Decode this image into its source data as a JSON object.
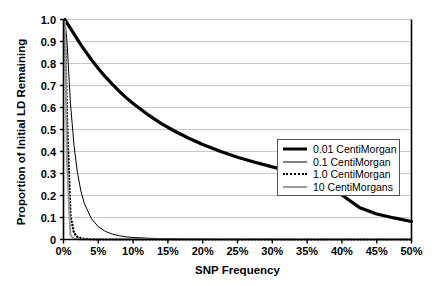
{
  "chart_data": {
    "type": "line",
    "title": "",
    "xlabel": "SNP Frequency",
    "ylabel": "Proportion of Initial LD Remaining",
    "xlim": [
      0,
      50
    ],
    "ylim": [
      0,
      1.0
    ],
    "grid": true,
    "legend_position": "center-right",
    "xticks": [
      "0%",
      "5%",
      "10%",
      "15%",
      "20%",
      "25%",
      "30%",
      "35%",
      "40%",
      "45%",
      "50%"
    ],
    "xtick_values": [
      0,
      5,
      10,
      15,
      20,
      25,
      30,
      35,
      40,
      45,
      50
    ],
    "yticks": [
      "0",
      "0.1",
      "0.2",
      "0.3",
      "0.4",
      "0.5",
      "0.6",
      "0.7",
      "0.8",
      "0.9",
      "1.0"
    ],
    "ytick_values": [
      0,
      0.1,
      0.2,
      0.3,
      0.4,
      0.5,
      0.6,
      0.7,
      0.8,
      0.9,
      1.0
    ],
    "x": [
      0.2,
      0.5,
      1,
      1.5,
      2,
      2.5,
      3,
      4,
      5,
      6,
      7,
      8,
      9,
      10,
      12,
      14,
      16,
      18,
      20,
      22.5,
      25,
      27.5,
      30,
      32.5,
      35,
      37.5,
      40,
      42.5,
      45,
      47.5,
      50
    ],
    "series": [
      {
        "name": "0.01 CentiMorgan",
        "color": "#000000",
        "width": 3.2,
        "style": "solid",
        "values": [
          1.0,
          0.985,
          0.96,
          0.935,
          0.91,
          0.885,
          0.862,
          0.818,
          0.777,
          0.74,
          0.706,
          0.674,
          0.645,
          0.618,
          0.57,
          0.528,
          0.492,
          0.46,
          0.432,
          0.401,
          0.374,
          0.351,
          0.33,
          0.311,
          0.294,
          0.278,
          0.202,
          0.146,
          0.116,
          0.098,
          0.082
        ]
      },
      {
        "name": "0.1 CentiMorgan",
        "color": "#000000",
        "width": 1.0,
        "style": "solid",
        "values": [
          1.0,
          0.9,
          0.62,
          0.43,
          0.305,
          0.22,
          0.163,
          0.095,
          0.058,
          0.037,
          0.025,
          0.017,
          0.012,
          0.009,
          0.006,
          0.004,
          0.003,
          0.002,
          0.002,
          0.001,
          0.001,
          0.001,
          0.001,
          0.0,
          0.0,
          0.0,
          0.0,
          0.0,
          0.0,
          0.0,
          0.0
        ]
      },
      {
        "name": "1.0 CentiMorgan",
        "color": "#000000",
        "width": 2.5,
        "style": "dotted",
        "values": [
          0.98,
          0.55,
          0.11,
          0.03,
          0.012,
          0.006,
          0.003,
          0.001,
          0.0,
          0.0,
          0.0,
          0.0,
          0.0,
          0.0,
          0.0,
          0.0,
          0.0,
          0.0,
          0.0,
          0.0,
          0.0,
          0.0,
          0.0,
          0.0,
          0.0,
          0.0,
          0.0,
          0.0,
          0.0,
          0.0,
          0.0
        ]
      },
      {
        "name": "10 CentiMorgans",
        "color": "#9a9a9a",
        "width": 2.0,
        "style": "solid",
        "values": [
          0.99,
          0.35,
          0.02,
          0.004,
          0.001,
          0.0,
          0.0,
          0.0,
          0.0,
          0.0,
          0.0,
          0.0,
          0.0,
          0.0,
          0.0,
          0.0,
          0.0,
          0.0,
          0.0,
          0.0,
          0.0,
          0.0,
          0.0,
          0.0,
          0.0,
          0.0,
          0.0,
          0.0,
          0.0,
          0.0,
          0.0
        ]
      }
    ],
    "legend": [
      {
        "label": "0.01 CentiMorgan",
        "key": "thick-black-line"
      },
      {
        "label": "0.1 CentiMorgan",
        "key": "thin-black-line"
      },
      {
        "label": "1.0 CentiMorgan",
        "key": "dotted-black-line"
      },
      {
        "label": "10 CentiMorgans",
        "key": "gray-line"
      }
    ],
    "colors": {
      "axis": "#000000",
      "grid": "#c9c9c9",
      "background": "#ffffff",
      "gray_series": "#9a9a9a"
    }
  }
}
